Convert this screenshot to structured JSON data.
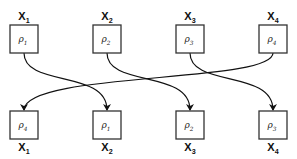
{
  "diagram": {
    "top_row": [
      {
        "position": "X",
        "position_sub": "1",
        "node": "ρ",
        "node_sub": "1"
      },
      {
        "position": "X",
        "position_sub": "2",
        "node": "ρ",
        "node_sub": "2"
      },
      {
        "position": "X",
        "position_sub": "3",
        "node": "ρ",
        "node_sub": "3"
      },
      {
        "position": "X",
        "position_sub": "4",
        "node": "ρ",
        "node_sub": "4"
      }
    ],
    "bottom_row": [
      {
        "position": "X",
        "position_sub": "1",
        "node": "ρ",
        "node_sub": "4"
      },
      {
        "position": "X",
        "position_sub": "2",
        "node": "ρ",
        "node_sub": "1"
      },
      {
        "position": "X",
        "position_sub": "3",
        "node": "ρ",
        "node_sub": "2"
      },
      {
        "position": "X",
        "position_sub": "4",
        "node": "ρ",
        "node_sub": "3"
      }
    ],
    "edges": [
      {
        "from": 0,
        "to": 1
      },
      {
        "from": 1,
        "to": 2
      },
      {
        "from": 2,
        "to": 3
      },
      {
        "from": 3,
        "to": 0
      }
    ]
  }
}
